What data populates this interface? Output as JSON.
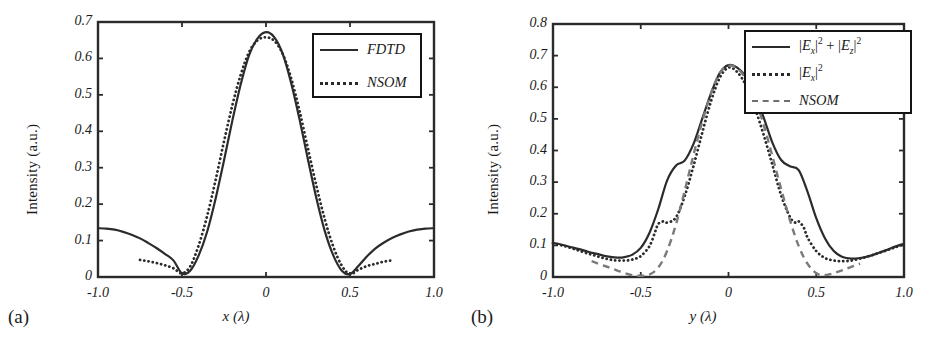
{
  "figure": {
    "background": "#ffffff",
    "ink": "#2b2b2b",
    "gray": "#7a7a7a"
  },
  "panels": [
    {
      "tag": "(a)",
      "ylabel": "Intensity (a.u.)",
      "xlabel_html": "x (λ)",
      "xlabel": "x (λ)",
      "yticks": [
        "0",
        "0.1",
        "0.2",
        "0.3",
        "0.4",
        "0.5",
        "0.6",
        "0.7"
      ],
      "xticks": [
        "-1.0",
        "-0.5",
        "0",
        "0.5",
        "1.0"
      ],
      "legend": [
        {
          "label": "FDTD",
          "style": "solid",
          "color": "#2b2b2b"
        },
        {
          "label": "NSOM",
          "style": "dotted",
          "color": "#2b2b2b"
        }
      ]
    },
    {
      "tag": "(b)",
      "ylabel": "Intensity (a.u.)",
      "xlabel": "y (λ)",
      "yticks": [
        "0",
        "0.1",
        "0.2",
        "0.3",
        "0.4",
        "0.5",
        "0.6",
        "0.7",
        "0.8"
      ],
      "xticks": [
        "-1.0",
        "-0.5",
        "0",
        "0.5",
        "1.0"
      ],
      "legend": [
        {
          "label": "|Ex|^2 + |Ez|^2",
          "style": "solid",
          "color": "#2b2b2b"
        },
        {
          "label": "|Ex|^2",
          "style": "dotted",
          "color": "#2b2b2b"
        },
        {
          "label": "NSOM",
          "style": "dashed",
          "color": "#7a7a7a"
        }
      ]
    }
  ],
  "chart_data": [
    {
      "type": "line",
      "panel": "(a)",
      "title": "",
      "xlabel": "x (λ)",
      "ylabel": "Intensity (a.u.)",
      "xlim": [
        -1.0,
        1.0
      ],
      "ylim": [
        0,
        0.7
      ],
      "xticks": [
        -1.0,
        -0.5,
        0,
        0.5,
        1.0
      ],
      "yticks": [
        0,
        0.1,
        0.2,
        0.3,
        0.4,
        0.5,
        0.6,
        0.7
      ],
      "grid": false,
      "legend_position": "top-right",
      "series": [
        {
          "name": "FDTD",
          "style": "solid",
          "color": "#2b2b2b",
          "x": [
            -1.0,
            -0.95,
            -0.9,
            -0.85,
            -0.8,
            -0.75,
            -0.7,
            -0.65,
            -0.6,
            -0.55,
            -0.5,
            -0.45,
            -0.4,
            -0.35,
            -0.3,
            -0.25,
            -0.2,
            -0.15,
            -0.1,
            -0.05,
            0.0,
            0.05,
            0.1,
            0.15,
            0.2,
            0.25,
            0.3,
            0.35,
            0.4,
            0.45,
            0.5,
            0.55,
            0.6,
            0.65,
            0.7,
            0.75,
            0.8,
            0.85,
            0.9,
            0.95,
            1.0
          ],
          "y": [
            0.134,
            0.133,
            0.13,
            0.124,
            0.116,
            0.106,
            0.093,
            0.079,
            0.063,
            0.045,
            0.01,
            0.018,
            0.06,
            0.125,
            0.215,
            0.32,
            0.43,
            0.53,
            0.61,
            0.655,
            0.672,
            0.658,
            0.612,
            0.532,
            0.432,
            0.322,
            0.216,
            0.126,
            0.06,
            0.018,
            0.008,
            0.03,
            0.056,
            0.078,
            0.094,
            0.107,
            0.117,
            0.125,
            0.13,
            0.133,
            0.134
          ]
        },
        {
          "name": "NSOM",
          "style": "dotted",
          "color": "#2b2b2b",
          "x": [
            -0.75,
            -0.7,
            -0.65,
            -0.6,
            -0.55,
            -0.5,
            -0.45,
            -0.4,
            -0.35,
            -0.3,
            -0.25,
            -0.2,
            -0.15,
            -0.1,
            -0.05,
            0.0,
            0.05,
            0.1,
            0.15,
            0.2,
            0.25,
            0.3,
            0.35,
            0.4,
            0.45,
            0.5,
            0.55,
            0.6,
            0.65,
            0.7,
            0.75
          ],
          "y": [
            0.047,
            0.043,
            0.038,
            0.032,
            0.024,
            0.01,
            0.03,
            0.088,
            0.168,
            0.266,
            0.372,
            0.472,
            0.556,
            0.618,
            0.65,
            0.658,
            0.648,
            0.612,
            0.545,
            0.455,
            0.352,
            0.25,
            0.158,
            0.084,
            0.032,
            0.008,
            0.02,
            0.03,
            0.036,
            0.042,
            0.046
          ]
        }
      ]
    },
    {
      "type": "line",
      "panel": "(b)",
      "title": "",
      "xlabel": "y (λ)",
      "ylabel": "Intensity (a.u.)",
      "xlim": [
        -1.0,
        1.0
      ],
      "ylim": [
        0,
        0.8
      ],
      "xticks": [
        -1.0,
        -0.5,
        0,
        0.5,
        1.0
      ],
      "yticks": [
        0,
        0.1,
        0.2,
        0.3,
        0.4,
        0.5,
        0.6,
        0.7,
        0.8
      ],
      "grid": false,
      "legend_position": "top-right",
      "series": [
        {
          "name": "|Ex|^2 + |Ez|^2",
          "style": "solid",
          "color": "#2b2b2b",
          "x": [
            -1.0,
            -0.95,
            -0.9,
            -0.85,
            -0.8,
            -0.75,
            -0.7,
            -0.65,
            -0.6,
            -0.55,
            -0.5,
            -0.45,
            -0.4,
            -0.35,
            -0.3,
            -0.25,
            -0.2,
            -0.15,
            -0.1,
            -0.05,
            0.0,
            0.05,
            0.1,
            0.15,
            0.2,
            0.25,
            0.3,
            0.35,
            0.4,
            0.45,
            0.5,
            0.55,
            0.6,
            0.65,
            0.7,
            0.75,
            0.8,
            0.85,
            0.9,
            0.95,
            1.0
          ],
          "y": [
            0.108,
            0.102,
            0.095,
            0.088,
            0.08,
            0.073,
            0.066,
            0.062,
            0.062,
            0.07,
            0.092,
            0.14,
            0.215,
            0.305,
            0.352,
            0.368,
            0.42,
            0.5,
            0.58,
            0.645,
            0.67,
            0.662,
            0.632,
            0.58,
            0.505,
            0.425,
            0.37,
            0.35,
            0.338,
            0.27,
            0.186,
            0.122,
            0.082,
            0.063,
            0.058,
            0.06,
            0.066,
            0.075,
            0.085,
            0.096,
            0.105
          ]
        },
        {
          "name": "|Ex|^2",
          "style": "dotted",
          "color": "#2b2b2b",
          "x": [
            -1.0,
            -0.95,
            -0.9,
            -0.85,
            -0.8,
            -0.75,
            -0.7,
            -0.65,
            -0.6,
            -0.55,
            -0.5,
            -0.45,
            -0.42,
            -0.4,
            -0.37,
            -0.35,
            -0.3,
            -0.25,
            -0.2,
            -0.15,
            -0.1,
            -0.05,
            0.0,
            0.05,
            0.1,
            0.15,
            0.2,
            0.25,
            0.3,
            0.35,
            0.38,
            0.4,
            0.43,
            0.45,
            0.5,
            0.55,
            0.6,
            0.65,
            0.7,
            0.75,
            0.8,
            0.85,
            0.9,
            0.95,
            1.0
          ],
          "y": [
            0.107,
            0.1,
            0.092,
            0.083,
            0.074,
            0.066,
            0.058,
            0.053,
            0.052,
            0.055,
            0.066,
            0.098,
            0.14,
            0.168,
            0.176,
            0.172,
            0.188,
            0.255,
            0.35,
            0.455,
            0.555,
            0.63,
            0.662,
            0.648,
            0.605,
            0.535,
            0.45,
            0.355,
            0.258,
            0.19,
            0.172,
            0.176,
            0.155,
            0.125,
            0.082,
            0.06,
            0.052,
            0.05,
            0.052,
            0.058,
            0.066,
            0.075,
            0.084,
            0.094,
            0.103
          ]
        },
        {
          "name": "NSOM",
          "style": "dashed",
          "color": "#7a7a7a",
          "x": [
            -0.78,
            -0.75,
            -0.7,
            -0.65,
            -0.6,
            -0.55,
            -0.5,
            -0.45,
            -0.4,
            -0.35,
            -0.3,
            -0.25,
            -0.2,
            -0.15,
            -0.1,
            -0.05,
            0.0,
            0.05,
            0.1,
            0.15,
            0.2,
            0.25,
            0.3,
            0.35,
            0.4,
            0.45,
            0.5,
            0.55,
            0.6,
            0.65,
            0.7,
            0.75
          ],
          "y": [
            0.05,
            0.044,
            0.034,
            0.024,
            0.014,
            0.006,
            0.004,
            0.008,
            0.03,
            0.082,
            0.165,
            0.272,
            0.385,
            0.49,
            0.58,
            0.645,
            0.668,
            0.66,
            0.625,
            0.565,
            0.482,
            0.382,
            0.278,
            0.18,
            0.098,
            0.042,
            0.012,
            0.006,
            0.012,
            0.022,
            0.032,
            0.042
          ]
        }
      ]
    }
  ]
}
